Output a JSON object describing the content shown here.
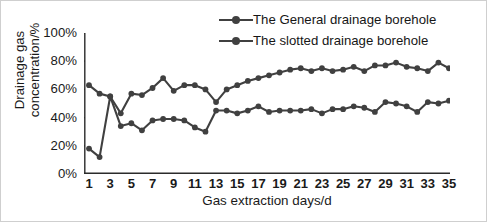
{
  "chart_data": {
    "type": "line",
    "title": "",
    "xlabel": "Gas extraction days/d",
    "ylabel": "Drainage gas concentration/%",
    "x": [
      1,
      2,
      3,
      4,
      5,
      6,
      7,
      8,
      9,
      10,
      11,
      12,
      13,
      14,
      15,
      16,
      17,
      18,
      19,
      20,
      21,
      22,
      23,
      24,
      25,
      26,
      27,
      28,
      29,
      30,
      31,
      32,
      33,
      34,
      35
    ],
    "xlim": [
      1,
      35
    ],
    "ylim": [
      0,
      100
    ],
    "xticks": [
      1,
      3,
      5,
      7,
      9,
      11,
      13,
      15,
      17,
      19,
      21,
      23,
      25,
      27,
      29,
      31,
      33,
      35
    ],
    "xtick_labels": [
      "1",
      "3",
      "5",
      "7",
      "9",
      "11",
      "13",
      "15",
      "17",
      "19",
      "21",
      "23",
      "25",
      "27",
      "29",
      "31",
      "33",
      "35"
    ],
    "yticks": [
      0,
      20,
      40,
      60,
      80,
      100
    ],
    "ytick_labels": [
      "0%",
      "20%",
      "40%",
      "60%",
      "80%",
      "100%"
    ],
    "grid": false,
    "legend_position": "top-right",
    "series": [
      {
        "name": "The slotted drainage borehole",
        "color": "#404040",
        "marker": "circle",
        "values": [
          63,
          57,
          55,
          43,
          57,
          56,
          61,
          68,
          59,
          63,
          63,
          60,
          51,
          60,
          63,
          66,
          68,
          70,
          72,
          74,
          75,
          73,
          75,
          73,
          74,
          76,
          73,
          77,
          77,
          79,
          76,
          75,
          73,
          79,
          75
        ]
      },
      {
        "name": "The General drainage borehole",
        "color": "#404040",
        "marker": "circle",
        "values": [
          18,
          12,
          55,
          34,
          36,
          31,
          38,
          39,
          39,
          38,
          33,
          30,
          45,
          45,
          43,
          45,
          48,
          44,
          45,
          45,
          45,
          46,
          43,
          46,
          46,
          48,
          47,
          44,
          51,
          50,
          48,
          44,
          51,
          50,
          52
        ]
      }
    ]
  },
  "legend": {
    "items": [
      {
        "label": "The General drainage borehole",
        "marker": "line-with-circle-marker"
      },
      {
        "label": "The slotted drainage borehole",
        "marker": "line-with-circle-marker"
      }
    ]
  },
  "axes": {
    "y_title": "Drainage gas concentration/%",
    "x_title": "Gas extraction days/d"
  },
  "colors": {
    "series": "#404040",
    "axis": "#2b2b2b",
    "text": "#161616",
    "background": "#ffffff",
    "frame": "#cfcfcf"
  }
}
